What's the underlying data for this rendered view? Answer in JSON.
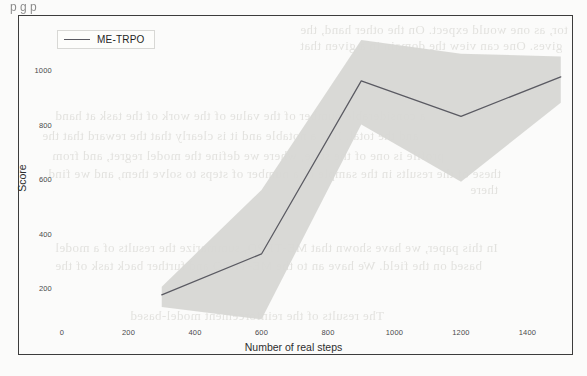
{
  "figure": {
    "legend": {
      "entries": [
        {
          "label": "ME-TRPO",
          "color": "#5a5a62"
        }
      ]
    },
    "frame_color": "#3c3c3c",
    "band_color": "#d7d7d4",
    "line_color": "#5a5a62"
  },
  "scan_artifacts": {
    "top_text": "p       g p",
    "bleed_lines": [
      "tor, as one would expect. On the other hand, the",
      "gives. One can view the domain in a given that",
      "a considerable number of the value of the work of the task at hand",
      "and the total. It is a notable and it is clearly that the reward that the",
      "profile is one of the state, where we define the model regret, and from",
      "these of the results in the sample of a number of steps to solve them, and we find",
      "there",
      "In this paper, we have shown that ME-TRPO, summarize the results of a model",
      "based on the field. We have an to the ME-TRPO and further back task of the",
      "The results of the reinforcement model-based"
    ]
  },
  "chart_data": {
    "type": "line",
    "title": "",
    "xlabel": "Number of real steps",
    "ylabel": "Score",
    "xlim": [
      0,
      1560
    ],
    "ylim": [
      60,
      1120
    ],
    "xticks": [
      0,
      200,
      400,
      600,
      800,
      1000,
      1200,
      1400
    ],
    "yticks": [
      200,
      400,
      600,
      800,
      1000
    ],
    "grid": false,
    "legend_position": "upper left",
    "series": [
      {
        "name": "ME-TRPO",
        "x": [
          300,
          600,
          900,
          1200,
          1500
        ],
        "values": [
          175,
          325,
          960,
          830,
          975
        ],
        "band_lower": [
          130,
          85,
          800,
          590,
          880
        ],
        "band_upper": [
          205,
          560,
          1110,
          1060,
          1050
        ]
      }
    ]
  }
}
